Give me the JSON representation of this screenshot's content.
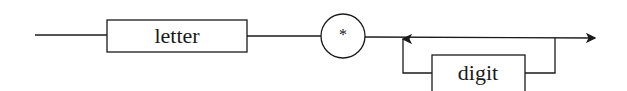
{
  "diagram": {
    "type": "syntax-railroad",
    "nodes": {
      "letter": {
        "label": "letter",
        "kind": "nonterminal"
      },
      "star": {
        "label": "*",
        "kind": "terminal"
      },
      "digit": {
        "label": "digit",
        "kind": "nonterminal",
        "loop": "zero-or-more"
      }
    },
    "colors": {
      "stroke": "#1a1a1a",
      "background": "#ffffff"
    }
  }
}
